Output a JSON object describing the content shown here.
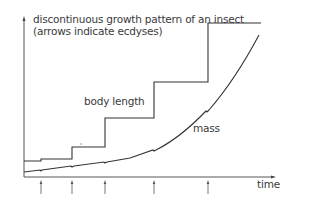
{
  "diagram": {
    "title_line1": "discontinuous growth pattern of an insect",
    "title_line2": "(arrows indicate ecdyses)",
    "series": [
      {
        "name": "body length",
        "label": "body length",
        "shape": "step"
      },
      {
        "name": "mass",
        "label": "mass",
        "shape": "exponential curve with small dips at each ecdysis"
      }
    ],
    "x_axis_label": "time",
    "ecdysis_count": 5,
    "colors": {
      "line": "#333333",
      "text": "#3a3a3a",
      "background": "#ffffff"
    }
  }
}
